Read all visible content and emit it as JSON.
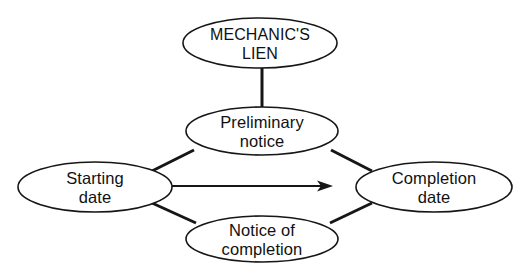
{
  "diagram": {
    "type": "node-link-diagram",
    "canvas": {
      "width": 528,
      "height": 276,
      "background": "#ffffff"
    },
    "stroke_color": "#161616",
    "text_color": "#111111",
    "nodes": [
      {
        "id": "mechanics-lien",
        "lines": [
          "MECHANIC'S",
          "LIEN"
        ],
        "text": "MECHANIC'S LIEN",
        "case": "upper",
        "cx": 260,
        "cy": 43,
        "rx": 77,
        "ry": 25
      },
      {
        "id": "preliminary-notice",
        "lines": [
          "Preliminary",
          "notice"
        ],
        "text": "Preliminary notice",
        "case": "normal",
        "cx": 262,
        "cy": 131,
        "rx": 76,
        "ry": 24
      },
      {
        "id": "starting-date",
        "lines": [
          "Starting",
          "date"
        ],
        "text": "Starting date",
        "case": "normal",
        "cx": 95,
        "cy": 187,
        "rx": 77,
        "ry": 25
      },
      {
        "id": "completion-date",
        "lines": [
          "Completion",
          "date"
        ],
        "text": "Completion date",
        "case": "normal",
        "cx": 434,
        "cy": 187,
        "rx": 78,
        "ry": 25
      },
      {
        "id": "notice-of-completion",
        "lines": [
          "Notice of",
          "completion"
        ],
        "text": "Notice of completion",
        "case": "normal",
        "cx": 262,
        "cy": 239,
        "rx": 76,
        "ry": 23
      }
    ],
    "connectors": [
      {
        "id": "lien-to-preliminary",
        "from": "mechanics-lien",
        "to": "preliminary-notice",
        "kind": "plain-line",
        "x1": 262,
        "y1": 68,
        "x2": 262,
        "y2": 108
      },
      {
        "id": "starting-to-preliminary",
        "from": "starting-date",
        "to": "preliminary-notice",
        "kind": "plain-line",
        "x1": 152,
        "y1": 171,
        "x2": 194,
        "y2": 150
      },
      {
        "id": "preliminary-to-completion",
        "from": "preliminary-notice",
        "to": "completion-date",
        "kind": "plain-line",
        "x1": 331,
        "y1": 150,
        "x2": 372,
        "y2": 171
      },
      {
        "id": "starting-to-notice",
        "from": "starting-date",
        "to": "notice-of-completion",
        "kind": "plain-line",
        "x1": 152,
        "y1": 203,
        "x2": 196,
        "y2": 223
      },
      {
        "id": "notice-to-completion",
        "from": "notice-of-completion",
        "to": "completion-date",
        "kind": "plain-line",
        "x1": 330,
        "y1": 223,
        "x2": 372,
        "y2": 203
      },
      {
        "id": "starting-to-completion-arrow",
        "from": "starting-date",
        "to": "completion-date",
        "kind": "arrow",
        "x1": 172,
        "y1": 186,
        "x2": 332,
        "y2": 186
      }
    ]
  }
}
